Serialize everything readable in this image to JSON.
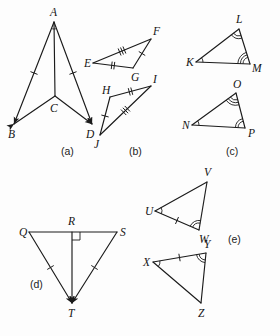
{
  "sheet": {
    "width": 280,
    "height": 336,
    "background": "#fdfdfd",
    "ink": "#1b1b1b"
  },
  "parts": [
    {
      "id": "a",
      "label": "(a)",
      "x": 61,
      "y": 155
    },
    {
      "id": "b",
      "label": "(b)",
      "x": 129,
      "y": 155
    },
    {
      "id": "c",
      "label": "(c)",
      "x": 226,
      "y": 155
    },
    {
      "id": "d",
      "label": "(d)",
      "x": 30,
      "y": 288
    },
    {
      "id": "e",
      "label": "(e)",
      "x": 228,
      "y": 243
    }
  ],
  "figures": {
    "a": {
      "name": "dart-abcd",
      "vertices": [
        {
          "name": "A",
          "label": "A",
          "px": 54,
          "py": 22,
          "lx": 50,
          "ly": 16
        },
        {
          "name": "B",
          "label": "B",
          "px": 14,
          "py": 124,
          "lx": 8,
          "ly": 138
        },
        {
          "name": "C",
          "label": "C",
          "px": 55,
          "py": 96,
          "lx": 50,
          "ly": 112
        },
        {
          "name": "D",
          "label": "D",
          "px": 92,
          "py": 124,
          "lx": 86,
          "ly": 138
        }
      ],
      "segments": [
        {
          "name": "segment-AB",
          "from": "A",
          "to": "B",
          "ticks": 1,
          "arrow": "to"
        },
        {
          "name": "segment-AD",
          "from": "A",
          "to": "D",
          "ticks": 1,
          "arrow": "to"
        },
        {
          "name": "segment-BC",
          "from": "B",
          "to": "C",
          "ticks": 0,
          "arrow": "from"
        },
        {
          "name": "segment-CD",
          "from": "C",
          "to": "D",
          "ticks": 0,
          "arrow": "to"
        },
        {
          "name": "segment-AC",
          "from": "A",
          "to": "C",
          "ticks": 0,
          "arrow": "none"
        }
      ],
      "angles": [
        {
          "name": "angle-BAC",
          "at": "A",
          "arcs": 1
        },
        {
          "name": "angle-CAD",
          "at": "A",
          "arcs": 1
        }
      ]
    },
    "b": {
      "name": "triangles-efg-hij",
      "triangles": [
        {
          "name": "triangle-efg",
          "vertices": [
            {
              "name": "E",
              "label": "E",
              "px": 93,
              "py": 63,
              "lx": 84,
              "ly": 67
            },
            {
              "name": "F",
              "label": "F",
              "px": 151,
              "py": 39,
              "lx": 153,
              "ly": 35
            },
            {
              "name": "G",
              "label": "G",
              "px": 133,
              "py": 68,
              "lx": 131,
              "ly": 81
            }
          ],
          "sides": [
            {
              "name": "side-EF",
              "from": "E",
              "to": "F",
              "ticks": 3
            },
            {
              "name": "side-FG",
              "from": "F",
              "to": "G",
              "ticks": 1
            },
            {
              "name": "side-EG",
              "from": "E",
              "to": "G",
              "ticks": 2
            }
          ]
        },
        {
          "name": "triangle-hij",
          "vertices": [
            {
              "name": "H",
              "label": "H",
              "px": 110,
              "py": 97,
              "lx": 102,
              "ly": 94
            },
            {
              "name": "I",
              "label": "I",
              "px": 151,
              "py": 86,
              "lx": 153,
              "ly": 83
            },
            {
              "name": "J",
              "label": "J",
              "px": 100,
              "py": 135,
              "lx": 94,
              "ly": 148
            }
          ],
          "sides": [
            {
              "name": "side-HI",
              "from": "H",
              "to": "I",
              "ticks": 2
            },
            {
              "name": "side-JI",
              "from": "J",
              "to": "I",
              "ticks": 3
            },
            {
              "name": "side-JH",
              "from": "J",
              "to": "H",
              "ticks": 1
            }
          ]
        }
      ]
    },
    "c": {
      "name": "triangles-klm-nop",
      "triangles": [
        {
          "name": "triangle-klm",
          "vertices": [
            {
              "name": "K",
              "label": "K",
              "px": 196,
              "py": 62,
              "lx": 186,
              "ly": 66
            },
            {
              "name": "L",
              "label": "L",
              "px": 239,
              "py": 29,
              "lx": 236,
              "ly": 23
            },
            {
              "name": "M",
              "label": "M",
              "px": 250,
              "py": 64,
              "lx": 252,
              "ly": 72
            }
          ],
          "sides": [
            {
              "name": "side-KL",
              "from": "K",
              "to": "L"
            },
            {
              "name": "side-LM",
              "from": "L",
              "to": "M"
            },
            {
              "name": "side-KM",
              "from": "K",
              "to": "M"
            }
          ],
          "angles": [
            {
              "name": "angle-K",
              "at": "K",
              "arcs": 1
            },
            {
              "name": "angle-L",
              "at": "L",
              "arcs": 2
            },
            {
              "name": "angle-M",
              "at": "M",
              "arcs": 3
            }
          ]
        },
        {
          "name": "triangle-nop",
          "vertices": [
            {
              "name": "N",
              "label": "N",
              "px": 192,
              "py": 125,
              "lx": 182,
              "ly": 129
            },
            {
              "name": "O",
              "label": "O",
              "px": 236,
              "py": 93,
              "lx": 233,
              "ly": 88
            },
            {
              "name": "P",
              "label": "P",
              "px": 245,
              "py": 128,
              "lx": 248,
              "ly": 137
            }
          ],
          "sides": [
            {
              "name": "side-NO",
              "from": "N",
              "to": "O"
            },
            {
              "name": "side-OP",
              "from": "O",
              "to": "P"
            },
            {
              "name": "side-NP",
              "from": "N",
              "to": "P"
            }
          ],
          "angles": [
            {
              "name": "angle-N",
              "at": "N",
              "arcs": 1
            },
            {
              "name": "angle-O",
              "at": "O",
              "arcs": 3
            },
            {
              "name": "angle-P",
              "at": "P",
              "arcs": 2
            }
          ]
        }
      ]
    },
    "d": {
      "name": "triangle-qst-with-altitude",
      "vertices": [
        {
          "name": "Q",
          "label": "Q",
          "px": 29,
          "py": 232,
          "lx": 19,
          "ly": 236
        },
        {
          "name": "R",
          "label": "R",
          "px": 72,
          "py": 232,
          "lx": 68,
          "ly": 225
        },
        {
          "name": "S",
          "label": "S",
          "px": 117,
          "py": 232,
          "lx": 120,
          "ly": 236
        },
        {
          "name": "T",
          "label": "T",
          "px": 72,
          "py": 303,
          "lx": 68,
          "ly": 317
        }
      ],
      "segments": [
        {
          "name": "segment-QS",
          "from": "Q",
          "to": "S",
          "ticks": 0,
          "arrow": "none"
        },
        {
          "name": "segment-QT",
          "from": "Q",
          "to": "T",
          "ticks": 1,
          "arrow": "to"
        },
        {
          "name": "segment-ST",
          "from": "S",
          "to": "T",
          "ticks": 1,
          "arrow": "to"
        },
        {
          "name": "segment-RT",
          "from": "R",
          "to": "T",
          "ticks": 0,
          "arrow": "to"
        }
      ],
      "right_angle": {
        "name": "right-angle-at-R",
        "at": "R",
        "size": 8,
        "side": "right"
      }
    },
    "e": {
      "name": "triangles-uvw-xyz",
      "triangles": [
        {
          "name": "triangle-uvw",
          "vertices": [
            {
              "name": "U",
              "label": "U",
              "px": 155,
              "py": 211,
              "lx": 145,
              "ly": 215
            },
            {
              "name": "V",
              "label": "V",
              "px": 207,
              "py": 182,
              "lx": 204,
              "ly": 176
            },
            {
              "name": "W",
              "label": "W",
              "px": 199,
              "py": 230,
              "lx": 199,
              "ly": 243
            }
          ],
          "sides": [
            {
              "name": "side-UV",
              "from": "U",
              "to": "V",
              "ticks": 0
            },
            {
              "name": "side-VW",
              "from": "V",
              "to": "W",
              "ticks": 0
            },
            {
              "name": "side-UW",
              "from": "U",
              "to": "W",
              "ticks": 1
            }
          ],
          "angles": [
            {
              "name": "angle-U",
              "at": "U",
              "arcs": 1
            },
            {
              "name": "angle-W",
              "at": "W",
              "arcs": 2
            }
          ]
        },
        {
          "name": "triangle-xyz",
          "vertices": [
            {
              "name": "X",
              "label": "X",
              "px": 153,
              "py": 262,
              "lx": 143,
              "ly": 266
            },
            {
              "name": "Y",
              "label": "Y",
              "px": 206,
              "py": 253,
              "lx": 204,
              "ly": 248
            },
            {
              "name": "Z",
              "label": "Z",
              "px": 201,
              "py": 303,
              "lx": 198,
              "ly": 317
            }
          ],
          "sides": [
            {
              "name": "side-XY",
              "from": "X",
              "to": "Y",
              "ticks": 1
            },
            {
              "name": "side-YZ",
              "from": "Y",
              "to": "Z",
              "ticks": 0
            },
            {
              "name": "side-XZ",
              "from": "X",
              "to": "Z",
              "ticks": 0
            }
          ],
          "angles": [
            {
              "name": "angle-X",
              "at": "X",
              "arcs": 1
            },
            {
              "name": "angle-Y",
              "at": "Y",
              "arcs": 2
            }
          ]
        }
      ]
    }
  }
}
